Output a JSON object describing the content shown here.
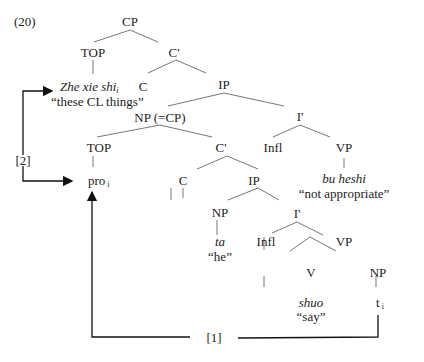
{
  "example_number": "(20)",
  "nodes": {
    "cp": "CP",
    "top1": "TOP",
    "cbar1": "C'",
    "topic_chinese": "Zhe xie shi",
    "topic_index": "i",
    "topic_gloss": "“these CL things”",
    "c1": "C",
    "ip1": "IP",
    "np_cp": "NP (=CP)",
    "ibar1": "I'",
    "top2": "TOP",
    "cbar2": "C'",
    "infl1": "Infl",
    "vp1": "VP",
    "pro": "pro",
    "pro_index": "i",
    "c2": "C",
    "ip2": "IP",
    "vp1_chinese": "bu heshi",
    "vp1_gloss": "“not appropriate”",
    "np2": "NP",
    "ibar2": "I'",
    "np2_chinese": "ta",
    "np2_gloss": "“he”",
    "infl2": "Infl",
    "vp2": "VP",
    "v": "V",
    "np3": "NP",
    "v_chinese": "shuo",
    "v_gloss": "“say”",
    "trace": "t",
    "trace_index": "i"
  },
  "arrows": {
    "label_1": "[1]",
    "label_2": "[2]"
  }
}
